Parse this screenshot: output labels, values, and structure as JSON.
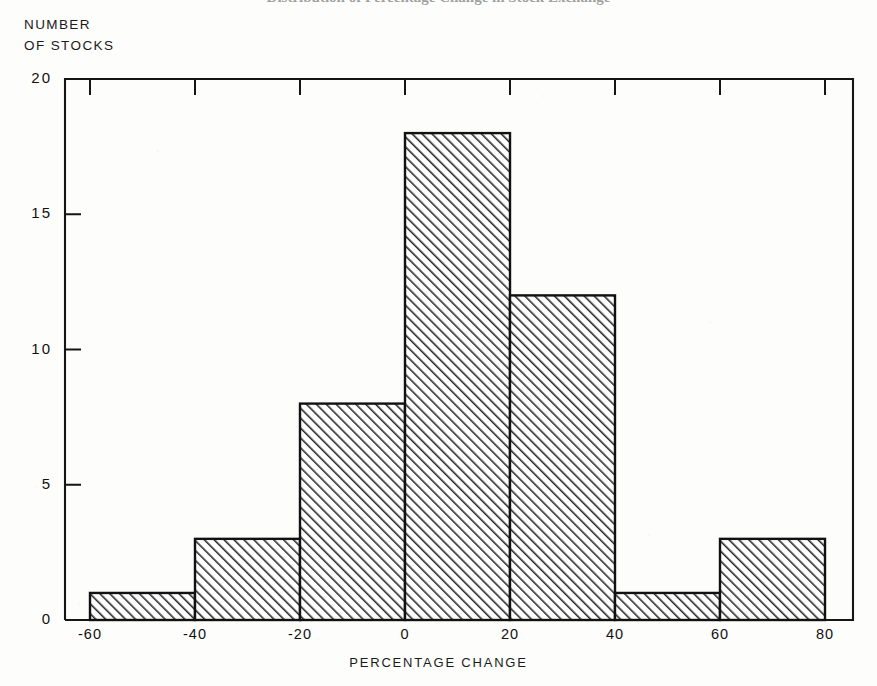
{
  "title": "Distribution of Percentage Change in Stock Exchange",
  "axes": {
    "y_caption_line1": "NUMBER",
    "y_caption_line2": "OF STOCKS",
    "x_caption": "PERCENTAGE CHANGE"
  },
  "chart_data": {
    "type": "bar",
    "title": "",
    "xlabel": "PERCENTAGE CHANGE",
    "ylabel": "NUMBER OF STOCKS",
    "categories": [
      "-60 to -40",
      "-40 to -20",
      "-20 to 0",
      "0 to 20",
      "20 to 40",
      "40 to 60",
      "60 to 80"
    ],
    "bin_edges": [
      -60,
      -40,
      -20,
      0,
      20,
      40,
      60,
      80
    ],
    "values": [
      1,
      3,
      8,
      18,
      12,
      1,
      3
    ],
    "xlim": [
      -60,
      80
    ],
    "ylim": [
      0,
      20
    ],
    "x_ticks": [
      "-60",
      "-40",
      "-20",
      "0",
      "20",
      "40",
      "60",
      "80"
    ],
    "x_tick_values": [
      -60,
      -40,
      -20,
      0,
      20,
      40,
      60,
      80
    ],
    "y_ticks": [
      "0",
      "5",
      "10",
      "15",
      "20"
    ],
    "y_tick_values": [
      0,
      5,
      10,
      15,
      20
    ],
    "grid": false,
    "legend": null,
    "bar_fill": "hatch-diagonal",
    "bar_color": "#1a1a1a"
  }
}
